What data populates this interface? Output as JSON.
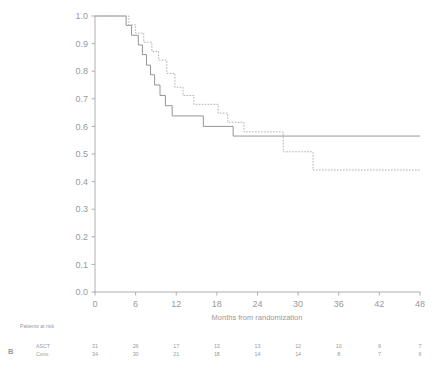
{
  "panel": {
    "letter": "B"
  },
  "chart_data": {
    "type": "line",
    "title": "",
    "xlabel": "Months from randomization",
    "ylabel": "",
    "xlim": [
      0,
      48
    ],
    "ylim": [
      0.0,
      1.0
    ],
    "grid": false,
    "legend_position": "none",
    "xticks": [
      0,
      6,
      12,
      18,
      24,
      30,
      36,
      42,
      48
    ],
    "xtick_labels": [
      "0",
      "6",
      "12",
      "18",
      "24",
      "30",
      "36",
      "42",
      "48"
    ],
    "yticks": [
      0.0,
      0.1,
      0.2,
      0.3,
      0.4,
      0.5,
      0.6,
      0.7,
      0.8,
      0.9,
      1.0
    ],
    "ytick_labels": [
      "0.0",
      "0.1",
      "0.2",
      "0.3",
      "0.4",
      "0.5",
      "0.6",
      "0.7",
      "0.8",
      "0.9",
      "1.0"
    ],
    "series": [
      {
        "name": "ASCT",
        "style": "solid",
        "color": "#8a8a8a",
        "x": [
          0,
          4.6,
          4.6,
          5.4,
          5.4,
          6.4,
          6.4,
          7.0,
          7.0,
          7.6,
          7.6,
          8.2,
          8.2,
          8.8,
          8.8,
          9.6,
          9.6,
          10.4,
          10.4,
          11.4,
          11.4,
          16.0,
          16.0,
          18.6,
          18.6,
          20.4,
          20.4,
          48.0
        ],
        "y": [
          1.0,
          1.0,
          0.966,
          0.966,
          0.93,
          0.93,
          0.895,
          0.895,
          0.86,
          0.86,
          0.822,
          0.822,
          0.787,
          0.787,
          0.75,
          0.75,
          0.712,
          0.712,
          0.675,
          0.675,
          0.638,
          0.638,
          0.6,
          0.6,
          0.6,
          0.6,
          0.565,
          0.565
        ]
      },
      {
        "name": "Conv.",
        "style": "dashed",
        "color": "#a9a9a9",
        "x": [
          0,
          5.0,
          5.0,
          6.0,
          6.0,
          7.2,
          7.2,
          8.4,
          8.4,
          9.4,
          9.4,
          10.6,
          10.6,
          11.8,
          11.8,
          13.0,
          13.0,
          14.6,
          14.6,
          18.2,
          18.2,
          19.6,
          19.6,
          22.0,
          22.0,
          27.8,
          27.8,
          32.2,
          32.2,
          48.0
        ],
        "y": [
          1.0,
          1.0,
          0.968,
          0.968,
          0.938,
          0.938,
          0.905,
          0.905,
          0.872,
          0.872,
          0.84,
          0.84,
          0.792,
          0.792,
          0.742,
          0.742,
          0.712,
          0.712,
          0.68,
          0.68,
          0.648,
          0.648,
          0.615,
          0.615,
          0.58,
          0.58,
          0.508,
          0.508,
          0.442,
          0.442
        ]
      }
    ],
    "annotations": []
  },
  "risk_table": {
    "header": "Patients at risk",
    "times": [
      0,
      6,
      12,
      18,
      24,
      30,
      36,
      42,
      48
    ],
    "rows": [
      {
        "label": "ASCT",
        "counts": [
          "31",
          "26",
          "17",
          "13",
          "13",
          "12",
          "10",
          "9",
          "7"
        ]
      },
      {
        "label": "Conv.",
        "counts": [
          "34",
          "30",
          "21",
          "18",
          "14",
          "14",
          "8",
          "7",
          "6"
        ]
      }
    ]
  }
}
